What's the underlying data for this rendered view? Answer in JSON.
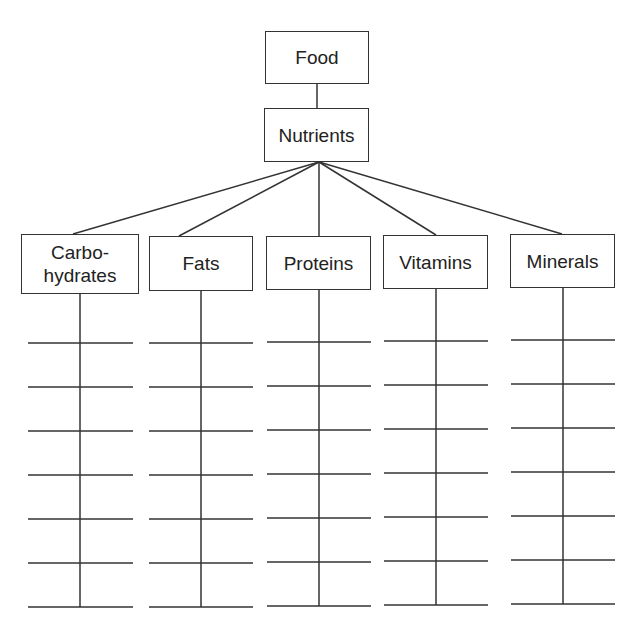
{
  "diagram": {
    "root": {
      "label": "Food"
    },
    "child": {
      "label": "Nutrients"
    },
    "categories": [
      {
        "label": "Carbo-\nhydrates",
        "blank_lines": 7
      },
      {
        "label": "Fats",
        "blank_lines": 7
      },
      {
        "label": "Proteins",
        "blank_lines": 7
      },
      {
        "label": "Vitamins",
        "blank_lines": 7
      },
      {
        "label": "Minerals",
        "blank_lines": 7
      }
    ]
  }
}
